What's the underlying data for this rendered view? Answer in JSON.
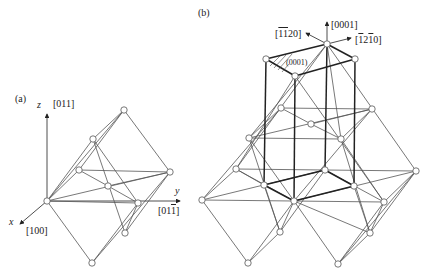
{
  "panel_a": {
    "label": "(a)",
    "axes": {
      "z": {
        "name": "z",
        "direction": "[011]"
      },
      "y": {
        "name": "y",
        "direction_parts": [
          "[01",
          "1",
          "]"
        ]
      },
      "x": {
        "name": "x",
        "direction": "[100]"
      }
    }
  },
  "panel_b": {
    "label": "(b)",
    "directions": {
      "c_axis": "[0001]",
      "left": {
        "parts": [
          "[",
          "1",
          "",
          "1",
          "20]"
        ]
      },
      "right": {
        "parts": [
          "[",
          "1",
          "2",
          "1",
          "0]"
        ]
      }
    },
    "plane": "(0001)"
  },
  "colors": {
    "line": "#555555",
    "bold_line": "#222222",
    "node_fill": "#ffffff",
    "node_stroke": "#555555"
  }
}
